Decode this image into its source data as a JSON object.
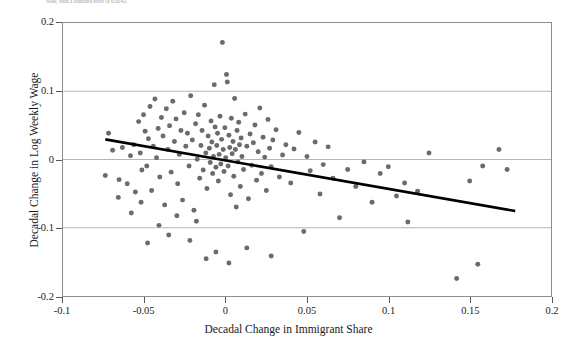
{
  "figure": {
    "caption_fragment": "Note, with a standard error of 0.0142.",
    "background_color": "#ffffff",
    "frame_color": "#8c8c8c",
    "point_color": "#6b6b6b",
    "line_color": "#000000",
    "grid_color": "#b4b4b4"
  },
  "chart_data": {
    "type": "scatter",
    "title": "",
    "xlabel": "Decadal Change in Immigrant Share",
    "ylabel": "Decadal Change in Log Weekly Wage",
    "xlim": [
      -0.1,
      0.2
    ],
    "ylim": [
      -0.2,
      0.2
    ],
    "xticks": [
      -0.1,
      -0.05,
      0,
      0.05,
      0.1,
      0.15,
      0.2
    ],
    "xticklabels": [
      "-0.1",
      "-0.05",
      "0",
      "0.05",
      "0.1",
      "0.15",
      "0.2"
    ],
    "yticks": [
      -0.2,
      -0.1,
      0,
      0.1,
      0.2
    ],
    "yticklabels": [
      "-0.2",
      "-0.1",
      "0",
      "0.1",
      "0.2"
    ],
    "grid": "horizontal",
    "legend": null,
    "marker": "circle",
    "marker_size": 5,
    "fit_line": {
      "type": "linear",
      "x_start": -0.074,
      "y_start": 0.0295,
      "x_end": 0.178,
      "y_end": -0.0755,
      "slope": -0.4167,
      "intercept": -0.0013
    },
    "points": [
      [
        -0.074,
        -0.0235
      ],
      [
        -0.0695,
        0.0135
      ],
      [
        -0.0655,
        -0.0295
      ],
      [
        -0.0635,
        0.0175
      ],
      [
        -0.0605,
        -0.0355
      ],
      [
        -0.0585,
        0.0055
      ],
      [
        -0.0565,
        0.0215
      ],
      [
        -0.0555,
        -0.0475
      ],
      [
        -0.0535,
        0.0555
      ],
      [
        -0.0525,
        0.0095
      ],
      [
        -0.0515,
        -0.0155
      ],
      [
        -0.0505,
        0.0655
      ],
      [
        -0.0495,
        0.0415
      ],
      [
        -0.0485,
        -0.0095
      ],
      [
        -0.0475,
        0.0305
      ],
      [
        -0.0465,
        0.0775
      ],
      [
        -0.0455,
        -0.0455
      ],
      [
        -0.0445,
        0.0195
      ],
      [
        -0.0435,
        0.0885
      ],
      [
        -0.0425,
        0.0025
      ],
      [
        -0.0415,
        0.0455
      ],
      [
        -0.0405,
        -0.0255
      ],
      [
        -0.0395,
        0.0615
      ],
      [
        -0.0385,
        0.0345
      ],
      [
        -0.0375,
        -0.0665
      ],
      [
        -0.0365,
        0.0745
      ],
      [
        -0.0355,
        0.0145
      ],
      [
        -0.0345,
        0.0495
      ],
      [
        -0.0335,
        -0.0185
      ],
      [
        -0.0325,
        0.0855
      ],
      [
        -0.0315,
        0.0265
      ],
      [
        -0.0305,
        0.0595
      ],
      [
        -0.0295,
        -0.0355
      ],
      [
        -0.0285,
        0.0075
      ],
      [
        -0.0275,
        0.0425
      ],
      [
        -0.0265,
        -0.0595
      ],
      [
        -0.0255,
        0.0685
      ],
      [
        -0.0245,
        0.0195
      ],
      [
        -0.0235,
        0.0385
      ],
      [
        -0.0225,
        -0.0095
      ],
      [
        -0.0215,
        0.0935
      ],
      [
        -0.0205,
        0.0285
      ],
      [
        -0.0195,
        -0.0745
      ],
      [
        -0.0185,
        0.0525
      ],
      [
        -0.0175,
        0.0005
      ],
      [
        -0.0168,
        0.0655
      ],
      [
        -0.016,
        -0.0275
      ],
      [
        -0.0152,
        0.0205
      ],
      [
        -0.0145,
        0.0425
      ],
      [
        -0.0138,
        -0.0155
      ],
      [
        -0.013,
        0.0795
      ],
      [
        -0.0122,
        0.0095
      ],
      [
        -0.0115,
        -0.0425
      ],
      [
        -0.0108,
        0.0345
      ],
      [
        -0.01,
        0.0165
      ],
      [
        -0.0095,
        -0.0045
      ],
      [
        -0.009,
        0.0565
      ],
      [
        -0.0085,
        0.0255
      ],
      [
        -0.008,
        -0.0205
      ],
      [
        -0.0075,
        0.0045
      ],
      [
        -0.007,
        0.1095
      ],
      [
        -0.0065,
        0.0475
      ],
      [
        -0.006,
        -0.0115
      ],
      [
        -0.0055,
        0.0205
      ],
      [
        -0.005,
        0.0385
      ],
      [
        -0.0045,
        -0.0315
      ],
      [
        -0.004,
        0.0075
      ],
      [
        -0.0035,
        0.0635
      ],
      [
        -0.003,
        -0.0065
      ],
      [
        -0.0025,
        0.0295
      ],
      [
        -0.002,
        0.1715
      ],
      [
        -0.0015,
        0.0145
      ],
      [
        -0.001,
        -0.0175
      ],
      [
        -0.0005,
        0.0465
      ],
      [
        0.0,
        0.0025
      ],
      [
        0.0005,
        0.1245
      ],
      [
        0.001,
        0.1135
      ],
      [
        0.0015,
        -0.0095
      ],
      [
        0.002,
        0.0355
      ],
      [
        0.0025,
        0.0175
      ],
      [
        0.003,
        -0.0515
      ],
      [
        0.0035,
        0.0605
      ],
      [
        0.004,
        0.0085
      ],
      [
        0.0045,
        0.0265
      ],
      [
        0.005,
        -0.0245
      ],
      [
        0.0055,
        0.0895
      ],
      [
        0.006,
        0.0145
      ],
      [
        0.0065,
        -0.0695
      ],
      [
        0.007,
        0.0425
      ],
      [
        0.0075,
        -0.0035
      ],
      [
        0.008,
        0.0545
      ],
      [
        0.0085,
        0.0215
      ],
      [
        0.009,
        -0.0395
      ],
      [
        0.0095,
        0.0315
      ],
      [
        0.01,
        0.0045
      ],
      [
        0.011,
        -0.0145
      ],
      [
        0.012,
        0.0665
      ],
      [
        0.013,
        0.0195
      ],
      [
        0.014,
        -0.0575
      ],
      [
        0.015,
        0.0375
      ],
      [
        0.016,
        -0.0085
      ],
      [
        0.017,
        0.0245
      ],
      [
        0.018,
        0.0505
      ],
      [
        0.019,
        -0.0305
      ],
      [
        0.02,
        0.0115
      ],
      [
        0.021,
        0.0755
      ],
      [
        0.022,
        -0.0205
      ],
      [
        0.023,
        0.0325
      ],
      [
        0.024,
        0.0035
      ],
      [
        0.025,
        -0.0455
      ],
      [
        0.026,
        0.0585
      ],
      [
        0.027,
        0.0165
      ],
      [
        0.028,
        -0.0105
      ],
      [
        0.029,
        0.0285
      ],
      [
        0.031,
        0.0435
      ],
      [
        0.033,
        -0.0255
      ],
      [
        0.035,
        0.0065
      ],
      [
        0.037,
        0.0215
      ],
      [
        0.04,
        -0.0345
      ],
      [
        0.042,
        0.0155
      ],
      [
        0.045,
        0.0395
      ],
      [
        0.048,
        -0.1055
      ],
      [
        0.05,
        0.0045
      ],
      [
        0.052,
        -0.0165
      ],
      [
        0.055,
        0.0255
      ],
      [
        0.058,
        -0.0505
      ],
      [
        0.06,
        -0.0075
      ],
      [
        0.063,
        0.0185
      ],
      [
        0.066,
        -0.0275
      ],
      [
        0.07,
        -0.0855
      ],
      [
        0.075,
        -0.0145
      ],
      [
        0.08,
        -0.0395
      ],
      [
        0.085,
        -0.0035
      ],
      [
        0.09,
        -0.0625
      ],
      [
        0.095,
        -0.0205
      ],
      [
        0.1,
        -0.0105
      ],
      [
        0.105,
        -0.0535
      ],
      [
        0.11,
        -0.0345
      ],
      [
        0.112,
        -0.0915
      ],
      [
        0.118,
        -0.0465
      ],
      [
        0.125,
        0.0095
      ],
      [
        0.142,
        -0.1745
      ],
      [
        0.15,
        -0.0315
      ],
      [
        0.155,
        -0.1535
      ],
      [
        0.158,
        -0.0095
      ],
      [
        0.168,
        0.0145
      ],
      [
        0.173,
        -0.0145
      ],
      [
        -0.048,
        -0.1225
      ],
      [
        -0.041,
        -0.0965
      ],
      [
        -0.035,
        -0.1105
      ],
      [
        -0.03,
        -0.0825
      ],
      [
        -0.022,
        -0.1185
      ],
      [
        -0.018,
        -0.0905
      ],
      [
        -0.012,
        -0.1455
      ],
      [
        -0.006,
        -0.1355
      ],
      [
        0.002,
        -0.1515
      ],
      [
        0.013,
        -0.1295
      ],
      [
        0.028,
        -0.1415
      ],
      [
        -0.058,
        -0.0785
      ],
      [
        -0.052,
        -0.0625
      ],
      [
        -0.066,
        -0.0555
      ],
      [
        -0.072,
        0.0385
      ]
    ]
  }
}
